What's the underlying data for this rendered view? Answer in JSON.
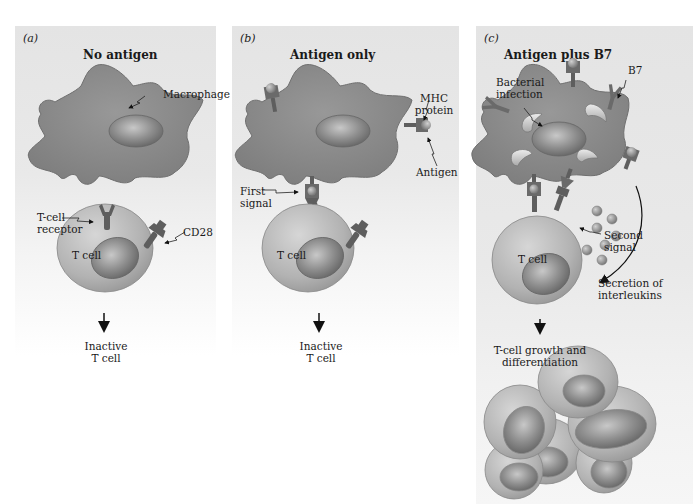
{
  "panels": [
    {
      "id": "a",
      "label": "(a)",
      "title": "No antigen",
      "labels": {
        "macrophage": "Macrophage",
        "tcell_receptor_1": "T-cell",
        "tcell_receptor_2": "receptor",
        "cd28": "CD28",
        "tcell": "T cell",
        "outcome_1": "Inactive",
        "outcome_2": "T cell"
      }
    },
    {
      "id": "b",
      "label": "(b)",
      "title": "Antigen only",
      "labels": {
        "mhc_1": "MHC",
        "mhc_2": "protein",
        "antigen": "Antigen",
        "first_signal_1": "First",
        "first_signal_2": "signal",
        "tcell": "T cell",
        "outcome_1": "Inactive",
        "outcome_2": "T cell"
      }
    },
    {
      "id": "c",
      "label": "(c)",
      "title": "Antigen plus B7",
      "labels": {
        "bacterial_1": "Bacterial",
        "bacterial_2": "infection",
        "b7": "B7",
        "second_signal_1": "Second",
        "second_signal_2": "signal",
        "tcell": "T cell",
        "secretion_1": "Secretion of",
        "secretion_2": "interleukins",
        "outcome_1": "T-cell growth and",
        "outcome_2": "differentiation"
      }
    }
  ],
  "colors": {
    "panel_bg": "#e6e6e6",
    "macrophage": "#8a8a8a",
    "nucleus": "#9a9a9a",
    "tcell": "#b4b4b4",
    "receptor": "#5e5e5e",
    "antigen": "#a8a8a8"
  }
}
